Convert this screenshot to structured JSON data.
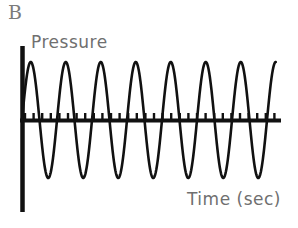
{
  "figure": {
    "panel_label": "B",
    "y_axis_title": "Pressure",
    "x_axis_title": "Time (sec)",
    "background_color": "#ffffff",
    "axis_color": "#111111",
    "trace_color": "#111111",
    "label_color": "#6f6f6f"
  },
  "chart_data": {
    "type": "line",
    "title": "B",
    "xlabel": "Time (sec)",
    "ylabel": "Pressure",
    "grid": false,
    "legend": null,
    "waveform": {
      "shape": "sine",
      "cycles": 7,
      "amplitude": 1.0,
      "period": 1.0,
      "baseline": 0.0,
      "phase_start_deg": 0,
      "damping": "none",
      "amplitude_constant": true
    },
    "axes": {
      "x_axis_start_px": 22,
      "x_axis_end_px": 281,
      "baseline_y_px": 120,
      "y_axis_x_px": 22,
      "y_axis_top_px": 46,
      "y_axis_bottom_px": 212,
      "x_tick_count": 30,
      "x_tick_spacing_px": 8.6,
      "x_tick_length_px": 6,
      "x_tick_direction": "up",
      "x_tick_labels": [],
      "y_tick_labels": []
    },
    "x": [
      0.0,
      0.125,
      0.25,
      0.375,
      0.5,
      0.625,
      0.75,
      0.875,
      1.0,
      1.125,
      1.25,
      1.375,
      1.5,
      1.625,
      1.75,
      1.875,
      2.0,
      2.125,
      2.25,
      2.375,
      2.5,
      2.625,
      2.75,
      2.875,
      3.0,
      3.125,
      3.25,
      3.375,
      3.5,
      3.625,
      3.75,
      3.875,
      4.0,
      4.125,
      4.25,
      4.375,
      4.5,
      4.625,
      4.75,
      4.875,
      5.0,
      5.125,
      5.25,
      5.375,
      5.5,
      5.625,
      5.75,
      5.875,
      6.0,
      6.125,
      6.25,
      6.375,
      6.5,
      6.625,
      6.75,
      6.875,
      7.0,
      7.125,
      7.25
    ],
    "y": [
      0.0,
      0.71,
      1.0,
      0.71,
      0.0,
      -0.71,
      -1.0,
      -0.71,
      0.0,
      0.71,
      1.0,
      0.71,
      0.0,
      -0.71,
      -1.0,
      -0.71,
      0.0,
      0.71,
      1.0,
      0.71,
      0.0,
      -0.71,
      -1.0,
      -0.71,
      0.0,
      0.71,
      1.0,
      0.71,
      0.0,
      -0.71,
      -1.0,
      -0.71,
      0.0,
      0.71,
      1.0,
      0.71,
      0.0,
      -0.71,
      -1.0,
      -0.71,
      0.0,
      0.71,
      1.0,
      0.71,
      0.0,
      -0.71,
      -1.0,
      -0.71,
      0.0,
      0.71,
      1.0,
      0.71,
      0.0,
      -0.71,
      -1.0,
      -0.71,
      0.0,
      0.71,
      0.92
    ],
    "peaks_x": [
      0.25,
      1.25,
      2.25,
      3.25,
      4.25,
      5.25,
      6.25
    ],
    "troughs_x": [
      0.75,
      1.75,
      2.75,
      3.75,
      4.75,
      5.75,
      6.75
    ],
    "xlim": [
      0,
      7.4
    ],
    "ylim": [
      -1.25,
      1.3
    ]
  }
}
